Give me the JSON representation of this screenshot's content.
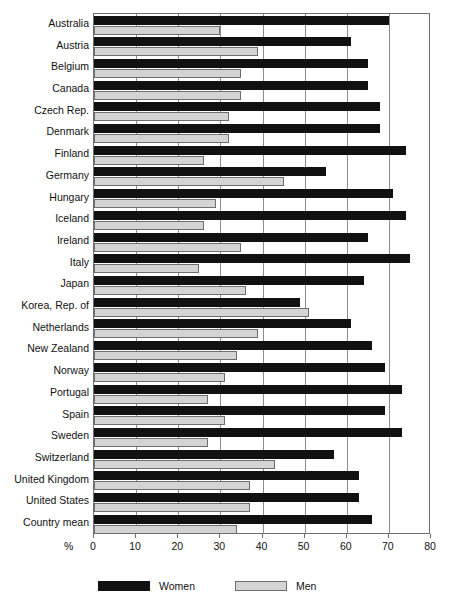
{
  "chart_data": {
    "type": "bar",
    "orientation": "horizontal",
    "title": "",
    "subtitle": "",
    "xlabel": "%",
    "ylabel": "",
    "xlim": [
      0,
      80
    ],
    "xticks": [
      0,
      10,
      20,
      30,
      40,
      50,
      60,
      70,
      80
    ],
    "xtick_labels": [
      "0",
      "10",
      "20",
      "30",
      "40",
      "50",
      "60",
      "70",
      "80"
    ],
    "grid": true,
    "grid_axis": "x",
    "legend_position": "bottom-left",
    "categories": [
      "Australia",
      "Austria",
      "Belgium",
      "Canada",
      "Czech Rep.",
      "Denmark",
      "Finland",
      "Germany",
      "Hungary",
      "Iceland",
      "Ireland",
      "Italy",
      "Japan",
      "Korea, Rep. of",
      "Netherlands",
      "New Zealand",
      "Norway",
      "Portugal",
      "Spain",
      "Sweden",
      "Switzerland",
      "United Kingdom",
      "United States",
      "Country mean"
    ],
    "series": [
      {
        "name": "Women",
        "color": "#111111",
        "values": [
          70,
          61,
          65,
          65,
          68,
          68,
          74,
          55,
          71,
          74,
          65,
          75,
          64,
          49,
          61,
          66,
          69,
          73,
          69,
          73,
          57,
          63,
          63,
          66
        ]
      },
      {
        "name": "Men",
        "color": "#d4d4d4",
        "values": [
          30,
          39,
          35,
          35,
          32,
          32,
          26,
          45,
          29,
          26,
          35,
          25,
          36,
          51,
          39,
          34,
          31,
          27,
          31,
          27,
          43,
          37,
          37,
          34
        ]
      }
    ]
  },
  "legend": {
    "items": [
      {
        "label": "Women",
        "swatch": "women"
      },
      {
        "label": "Men",
        "swatch": "men"
      }
    ]
  },
  "axis": {
    "unit_label": "%"
  }
}
